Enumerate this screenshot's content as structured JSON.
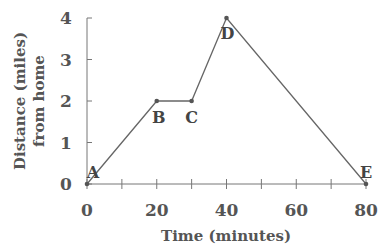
{
  "chart_data": {
    "type": "line",
    "title": "",
    "xlabel": "Time (minutes)",
    "ylabel_line1": "Distance (miles)",
    "ylabel_line2": "from home",
    "xlim": [
      0,
      80
    ],
    "ylim": [
      0,
      4
    ],
    "xticks_major": [
      0,
      20,
      40,
      60,
      80
    ],
    "xticks_minor": [
      10,
      30,
      50,
      70
    ],
    "yticks": [
      0,
      1,
      2,
      3,
      4
    ],
    "grid": false,
    "series": [
      {
        "name": "Trip",
        "points": [
          {
            "label": "A",
            "x": 0,
            "y": 0
          },
          {
            "label": "B",
            "x": 20,
            "y": 2
          },
          {
            "label": "C",
            "x": 30,
            "y": 2
          },
          {
            "label": "D",
            "x": 40,
            "y": 4
          },
          {
            "label": "E",
            "x": 80,
            "y": 0
          }
        ]
      }
    ],
    "colors": {
      "line": "#666666",
      "axis": "#777777",
      "text": "#555555"
    }
  }
}
